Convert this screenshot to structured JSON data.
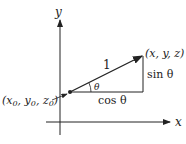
{
  "diagram": {
    "axes": {
      "x_label": "x",
      "y_label": "y"
    },
    "points": {
      "start": {
        "label": "(x",
        "sub_x": "0",
        "mid1": ", y",
        "sub_y": "0",
        "mid2": ", z",
        "sub_z": "0",
        "end": ")"
      },
      "end": {
        "label": "(x, y, z)"
      }
    },
    "triangle": {
      "hypotenuse_label": "1",
      "angle_label": "θ",
      "adjacent_label": "cos θ",
      "opposite_label": "sin θ"
    },
    "colors": {
      "stroke": "#222222",
      "background": "#ffffff"
    }
  }
}
